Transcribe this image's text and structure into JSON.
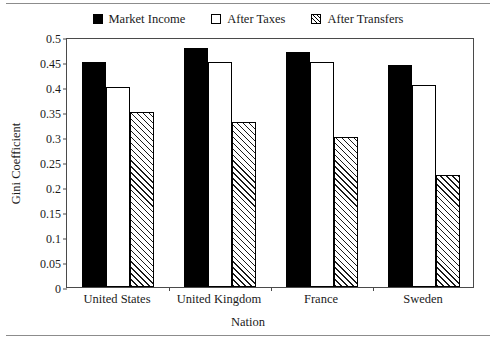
{
  "chart_data": {
    "type": "bar",
    "title": "",
    "xlabel": "Nation",
    "ylabel": "Gini Coefficient",
    "categories": [
      "United States",
      "United Kingdom",
      "France",
      "Sweden"
    ],
    "series": [
      {
        "name": "Market Income",
        "style": "solid",
        "values": [
          0.45,
          0.478,
          0.47,
          0.445
        ]
      },
      {
        "name": "After Taxes",
        "style": "empty",
        "values": [
          0.4,
          0.45,
          0.45,
          0.405
        ]
      },
      {
        "name": "After Transfers",
        "style": "hatch",
        "values": [
          0.35,
          0.33,
          0.3,
          0.225
        ]
      }
    ],
    "ylim": [
      0,
      0.5
    ],
    "yticks": [
      "0",
      "0.05",
      "0.1",
      "0.15",
      "0.2",
      "0.25",
      "0.3",
      "0.35",
      "0.4",
      "0.45",
      "0.5"
    ],
    "ytick_values": [
      0,
      0.05,
      0.1,
      0.15,
      0.2,
      0.25,
      0.3,
      0.35,
      0.4,
      0.45,
      0.5
    ],
    "grid": false,
    "legend_position": "top-center"
  },
  "colors": {
    "series_solid": "#000000",
    "series_empty": "#ffffff",
    "series_hatch": "#ffffff",
    "axis": "#4a4a4a",
    "text": "#1a1a1a",
    "background": "#ffffff"
  }
}
